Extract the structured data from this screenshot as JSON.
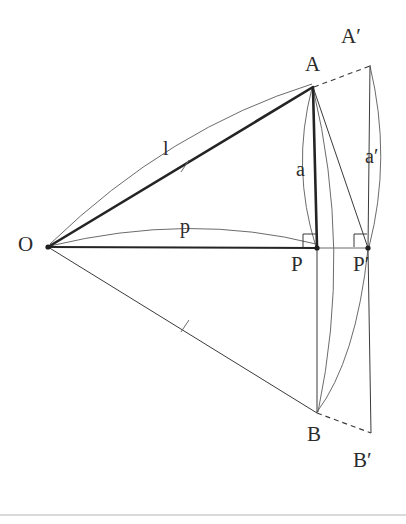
{
  "figure": {
    "background_color": "#ffffff",
    "ink_color": "#2b2b2b",
    "thin_ink_color": "#555555",
    "baseline_rule_color": "#b4b4b4",
    "width": 406,
    "height": 524
  },
  "points": {
    "O": {
      "label": "O",
      "x": 48,
      "y": 247,
      "label_x": 18,
      "label_y": 234,
      "marker": true
    },
    "A": {
      "label": "A",
      "x": 313,
      "y": 87,
      "label_x": 305,
      "label_y": 54,
      "marker": false
    },
    "Ap": {
      "label": "A′",
      "x": 370,
      "y": 65,
      "label_x": 341,
      "label_y": 26,
      "marker": false
    },
    "P": {
      "label": "P",
      "x": 317,
      "y": 248,
      "label_x": 291,
      "label_y": 254,
      "marker": true
    },
    "Pp": {
      "label": "P′",
      "x": 368,
      "y": 248,
      "label_x": 353,
      "label_y": 254,
      "marker": true
    },
    "B": {
      "label": "B",
      "x": 317,
      "y": 413,
      "label_x": 307,
      "label_y": 424,
      "marker": false
    },
    "Bp": {
      "label": "B′",
      "x": 371,
      "y": 433,
      "label_x": 353,
      "label_y": 450,
      "marker": false
    }
  },
  "measure_labels": [
    {
      "name": "length-l",
      "text": "l",
      "x": 163,
      "y": 138
    },
    {
      "name": "length-p",
      "text": "p",
      "x": 180,
      "y": 216
    },
    {
      "name": "length-a",
      "text": "a",
      "x": 296,
      "y": 159
    },
    {
      "name": "length-a-prime",
      "text": "a′",
      "x": 365,
      "y": 146
    }
  ],
  "segments": [
    {
      "name": "segment-O-A",
      "from": "O",
      "to": "A",
      "style": "thick",
      "note": "radius l, heavy"
    },
    {
      "name": "segment-O-P",
      "from": "O",
      "to": "Pp",
      "style": "thick",
      "note": "horizontal baseline through P to P prime"
    },
    {
      "name": "segment-O-B",
      "from": "O",
      "to": "B",
      "style": "thin",
      "note": "lower ray, tick marked"
    },
    {
      "name": "segment-A-P",
      "from": "A",
      "to": "P",
      "style": "thick",
      "note": "perpendicular drop a"
    },
    {
      "name": "segment-A-Pp",
      "from": "A",
      "to": "Pp",
      "style": "thin",
      "note": "chord A to P prime"
    },
    {
      "name": "segment-Ap-Pp",
      "from": "Ap",
      "to": "Pp",
      "style": "thin",
      "note": "perpendicular drop a prime"
    },
    {
      "name": "segment-P-B",
      "from": "P",
      "to": "B",
      "style": "thin",
      "note": "vertical through P"
    },
    {
      "name": "segment-Pp-Bp",
      "from": "Pp",
      "to": "Bp",
      "style": "thin",
      "note": "vertical through P prime"
    },
    {
      "name": "segment-A-Ap",
      "from": "A",
      "to": "Ap",
      "style": "dashed",
      "note": "dashed continuation to A prime"
    },
    {
      "name": "segment-B-Bp",
      "from": "B",
      "to": "Bp",
      "style": "dashed",
      "note": "dashed continuation to B prime"
    }
  ],
  "arcs": [
    {
      "name": "arc-l-over-OA",
      "note": "thin arc above segment OA labelled l"
    },
    {
      "name": "arc-p-over-OP",
      "note": "thin arc above segment OP labelled p"
    },
    {
      "name": "arc-a-A-to-P",
      "note": "thin arc from A bulging left down to P labelled a"
    },
    {
      "name": "arc-ap-Ap-to-Pp",
      "note": "thin arc from A prime bulging right down to P prime labelled a prime"
    },
    {
      "name": "arc-Pp-to-B",
      "note": "thin arc from P prime curving down-left to B"
    },
    {
      "name": "arc-A-to-B-right",
      "note": "thin arc from A through right side down to B"
    }
  ],
  "right_angle_marks": [
    {
      "name": "right-angle-at-P",
      "at": "P",
      "note": "square mark above-left of P"
    },
    {
      "name": "right-angle-at-Pp",
      "at": "Pp",
      "note": "square mark above-left of P prime"
    }
  ],
  "tick_marks": [
    {
      "name": "tick-on-OA",
      "x": 185,
      "y": 166,
      "note": "congruence tick on segment OA"
    },
    {
      "name": "tick-on-OB",
      "x": 185,
      "y": 326,
      "note": "congruence tick on segment OB"
    }
  ],
  "baseline_rule": {
    "name": "page-rule",
    "y": 515,
    "note": "faint horizontal rule near page bottom"
  }
}
